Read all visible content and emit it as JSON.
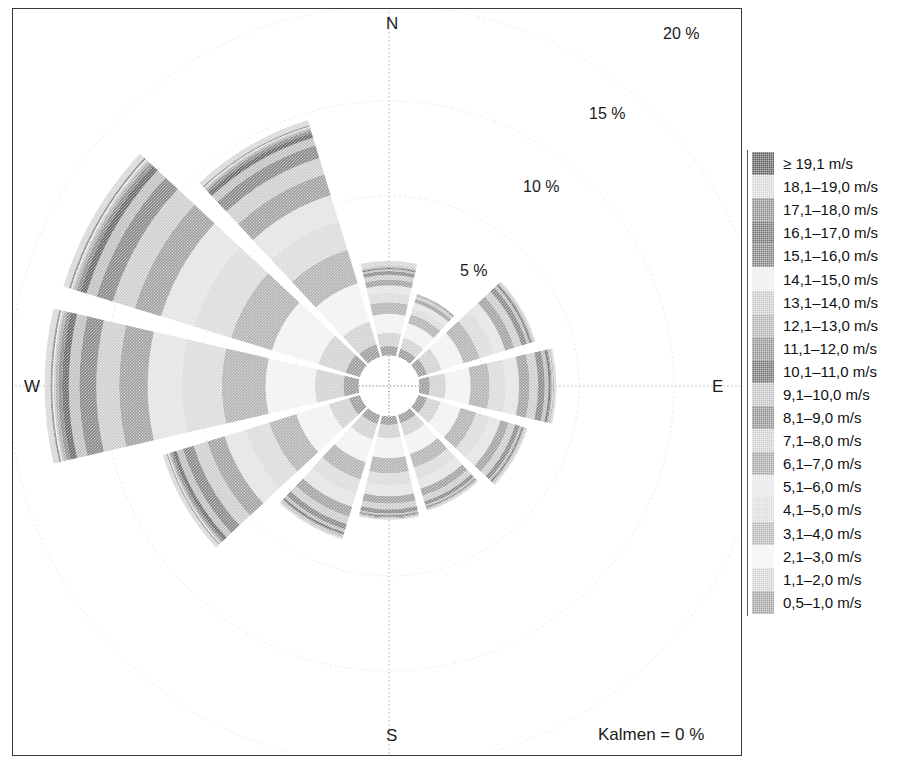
{
  "chart_data": {
    "type": "windrose",
    "title": "",
    "units": "%",
    "calm_label": "Kalmen = 0 %",
    "calm_value": 0,
    "center": {
      "x": 388,
      "y": 385
    },
    "px_per_percent": 19.0,
    "inner_hole_percent": 1.6,
    "sector_gap_degrees": 4,
    "radial_ticks": [
      {
        "value": 5,
        "label": "5 %",
        "x": 460,
        "y": 262
      },
      {
        "value": 10,
        "label": "10 %",
        "x": 523,
        "y": 178
      },
      {
        "value": 15,
        "label": "15 %",
        "x": 589,
        "y": 105
      },
      {
        "value": 20,
        "label": "20 %",
        "x": 663,
        "y": 25
      }
    ],
    "compass_labels": [
      {
        "dir": "N",
        "label": "N",
        "x": 386,
        "y": 14
      },
      {
        "dir": "E",
        "label": "E",
        "x": 712,
        "y": 377
      },
      {
        "dir": "S",
        "label": "S",
        "x": 386,
        "y": 726
      },
      {
        "dir": "W",
        "label": "W",
        "x": 24,
        "y": 377
      }
    ],
    "speed_classes": [
      {
        "label": "≥ 19,1 m/s",
        "color": "#585858"
      },
      {
        "label": "18,1–19,0 m/s",
        "color": "#d8d8d8"
      },
      {
        "label": "17,1–18,0 m/s",
        "color": "#8a8a8a"
      },
      {
        "label": "16,1–17,0 m/s",
        "color": "#707070"
      },
      {
        "label": "15,1–16,0 m/s",
        "color": "#7d7d7d"
      },
      {
        "label": "14,1–15,0 m/s",
        "color": "#ededed"
      },
      {
        "label": "13,1–14,0 m/s",
        "color": "#c9c9c9"
      },
      {
        "label": "12,1–13,0 m/s",
        "color": "#b0b0b0"
      },
      {
        "label": "11,1–12,0 m/s",
        "color": "#8f8f8f"
      },
      {
        "label": "10,1–11,0 m/s",
        "color": "#6e6e6e"
      },
      {
        "label": "9,1–10,0 m/s",
        "color": "#c2c2c2"
      },
      {
        "label": "8,1–9,0 m/s",
        "color": "#8c8c8c"
      },
      {
        "label": "7,1–8,0 m/s",
        "color": "#cfcfcf"
      },
      {
        "label": "6,1–7,0 m/s",
        "color": "#a3a3a3"
      },
      {
        "label": "5,1–6,0 m/s",
        "color": "#e4e4e4"
      },
      {
        "label": "4,1–5,0 m/s",
        "color": "#dcdcdc"
      },
      {
        "label": "3,1–4,0 m/s",
        "color": "#b4b4b4"
      },
      {
        "label": "2,1–3,0 m/s",
        "color": "#f2f2f2"
      },
      {
        "label": "1,1–2,0 m/s",
        "color": "#d2d2d2"
      },
      {
        "label": "0,5–1,0 m/s",
        "color": "#9e9e9e"
      }
    ],
    "sectors": [
      {
        "dir": "N",
        "angle_deg": 0,
        "total_percent": 6.3,
        "bands": [
          1.6,
          0.5,
          0.7,
          1.0,
          0.6,
          0.5,
          0.4,
          0.3,
          0.25,
          0.2,
          0.1,
          0.06,
          0.04,
          0.03,
          0.02,
          0.015,
          0.01,
          0.008,
          0.005,
          0.25
        ]
      },
      {
        "dir": "NNE",
        "angle_deg": 30,
        "total_percent": 5.0,
        "bands": [
          1.6,
          0.45,
          0.6,
          0.8,
          0.5,
          0.35,
          0.3,
          0.2,
          0.15,
          0.05,
          0.02,
          0.01,
          0.01,
          0.005,
          0.005,
          0.0,
          0.0,
          0.0,
          0.0,
          0.0
        ]
      },
      {
        "dir": "ENE",
        "angle_deg": 60,
        "total_percent": 8.0,
        "bands": [
          1.6,
          0.5,
          0.8,
          1.2,
          0.9,
          0.8,
          0.6,
          0.5,
          0.4,
          0.3,
          0.15,
          0.08,
          0.05,
          0.03,
          0.02,
          0.01,
          0.01,
          0.005,
          0.005,
          0.1
        ]
      },
      {
        "dir": "E",
        "angle_deg": 90,
        "total_percent": 8.8,
        "bands": [
          1.6,
          0.55,
          0.85,
          1.3,
          1.0,
          0.85,
          0.7,
          0.55,
          0.45,
          0.35,
          0.2,
          0.1,
          0.06,
          0.04,
          0.03,
          0.02,
          0.015,
          0.01,
          0.01,
          0.12
        ]
      },
      {
        "dir": "ESE",
        "angle_deg": 120,
        "total_percent": 7.6,
        "bands": [
          1.6,
          0.5,
          0.75,
          1.1,
          0.85,
          0.75,
          0.6,
          0.45,
          0.35,
          0.25,
          0.12,
          0.07,
          0.04,
          0.03,
          0.02,
          0.015,
          0.01,
          0.008,
          0.005,
          0.1
        ]
      },
      {
        "dir": "SSE",
        "angle_deg": 150,
        "total_percent": 6.7,
        "bands": [
          1.6,
          0.45,
          0.7,
          1.0,
          0.75,
          0.65,
          0.5,
          0.4,
          0.3,
          0.2,
          0.1,
          0.05,
          0.03,
          0.02,
          0.015,
          0.01,
          0.008,
          0.005,
          0.005,
          0.08
        ]
      },
      {
        "dir": "S",
        "angle_deg": 180,
        "total_percent": 6.9,
        "bands": [
          1.6,
          0.45,
          0.7,
          1.05,
          0.8,
          0.65,
          0.55,
          0.4,
          0.3,
          0.22,
          0.1,
          0.06,
          0.03,
          0.02,
          0.015,
          0.01,
          0.01,
          0.005,
          0.005,
          0.08
        ]
      },
      {
        "dir": "SSW",
        "angle_deg": 210,
        "total_percent": 8.5,
        "bands": [
          1.6,
          0.5,
          0.85,
          1.25,
          0.95,
          0.8,
          0.7,
          0.55,
          0.4,
          0.3,
          0.16,
          0.09,
          0.05,
          0.03,
          0.025,
          0.02,
          0.015,
          0.01,
          0.01,
          0.12
        ]
      },
      {
        "dir": "WSW",
        "angle_deg": 240,
        "total_percent": 12.5,
        "bands": [
          1.6,
          0.6,
          1.1,
          1.8,
          1.5,
          1.3,
          1.15,
          0.95,
          0.75,
          0.6,
          0.35,
          0.2,
          0.12,
          0.08,
          0.05,
          0.04,
          0.03,
          0.02,
          0.015,
          0.2
        ]
      },
      {
        "dir": "W",
        "angle_deg": 270,
        "total_percent": 18.2,
        "bands": [
          1.6,
          0.8,
          1.5,
          2.6,
          2.3,
          2.1,
          1.8,
          1.5,
          1.2,
          0.9,
          0.55,
          0.35,
          0.2,
          0.15,
          0.1,
          0.07,
          0.05,
          0.03,
          0.02,
          0.3
        ]
      },
      {
        "dir": "WNW",
        "angle_deg": 300,
        "total_percent": 18.0,
        "bands": [
          1.6,
          0.8,
          1.5,
          2.55,
          2.25,
          2.05,
          1.8,
          1.45,
          1.2,
          0.9,
          0.55,
          0.35,
          0.2,
          0.15,
          0.1,
          0.07,
          0.05,
          0.03,
          0.02,
          0.3
        ]
      },
      {
        "dir": "NNW",
        "angle_deg": 330,
        "total_percent": 14.6,
        "bands": [
          1.6,
          0.7,
          1.25,
          2.1,
          1.85,
          1.6,
          1.4,
          1.15,
          0.9,
          0.7,
          0.42,
          0.26,
          0.15,
          0.1,
          0.07,
          0.05,
          0.035,
          0.02,
          0.015,
          0.25
        ]
      }
    ],
    "grid": {
      "circles_percent": [
        5,
        10,
        15,
        20
      ],
      "axis_color": "#b9b9b9",
      "grid_color": "#e8e8e8"
    }
  }
}
